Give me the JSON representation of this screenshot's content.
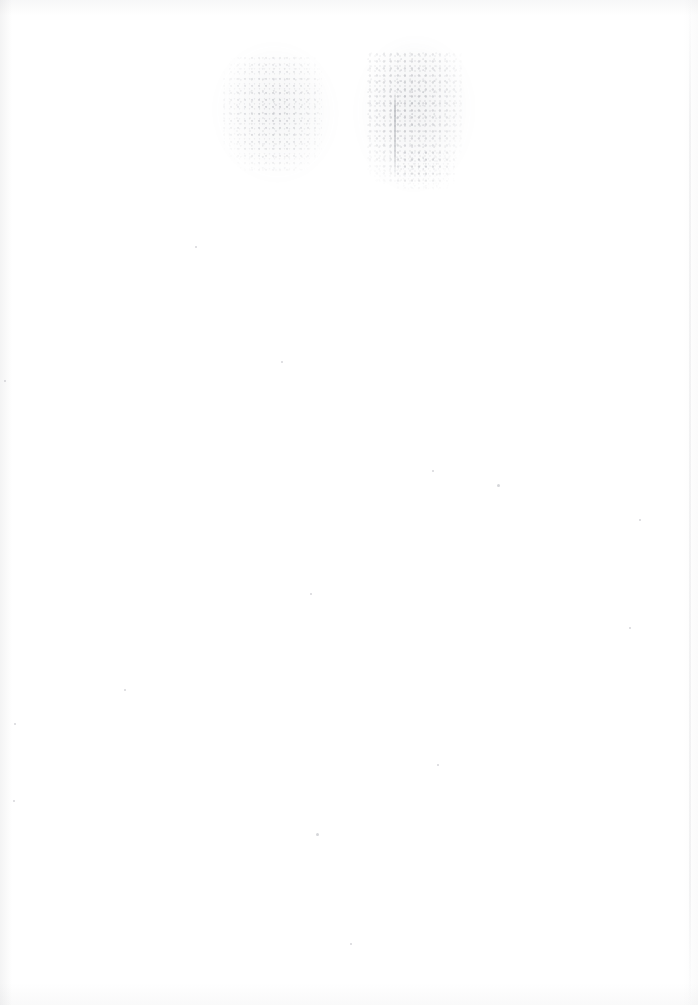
{
  "document": {
    "kind": "scanned-page",
    "page_label": "",
    "title": "",
    "body_text": "",
    "visible_text": "",
    "note": "Blank scanned sheet — no legible rendered text, headings, numbers, or UI controls appear in the pixels."
  },
  "page": {
    "width_px": 698,
    "height_px": 1005,
    "background_color": "#ffffff",
    "paper_tone": "#fdfdfd"
  },
  "artifacts": {
    "description": "Faint ink show-through from the reverse side of the sheet, plus scanner edge shading and a few dust specks.",
    "bleed_clusters": [
      {
        "name": "left-bleed-cluster",
        "x": 222,
        "y": 55,
        "width": 100,
        "height": 118,
        "ink_color": "#60646f",
        "opacity": 0.4
      },
      {
        "name": "right-bleed-cluster",
        "x": 366,
        "y": 52,
        "width": 96,
        "height": 132,
        "ink_color": "#585c68",
        "opacity": 0.45
      },
      {
        "name": "right-bleed-tail",
        "x": 396,
        "y": 150,
        "width": 62,
        "height": 40,
        "ink_color": "#6a6e78",
        "opacity": 0.28
      }
    ],
    "edge_shading": [
      {
        "name": "left-edge-shade",
        "edge": "left",
        "thickness_px": 12,
        "color": "#787a80"
      },
      {
        "name": "right-edge-shade",
        "edge": "right",
        "thickness_px": 26,
        "color": "#7d7f85"
      },
      {
        "name": "top-edge-shade",
        "edge": "top",
        "thickness_px": 16,
        "color": "#767880"
      },
      {
        "name": "bottom-edge-shade",
        "edge": "bottom",
        "thickness_px": 22,
        "color": "#767880"
      }
    ],
    "specks": [
      {
        "x": 316,
        "y": 833,
        "size": 3,
        "color": "#96989f"
      },
      {
        "x": 497,
        "y": 484,
        "size": 3,
        "color": "#96989f"
      },
      {
        "x": 432,
        "y": 470,
        "size": 2,
        "color": "#9a9ca2"
      },
      {
        "x": 124,
        "y": 689,
        "size": 2,
        "color": "#9a9ca2"
      },
      {
        "x": 14,
        "y": 723,
        "size": 2,
        "color": "#9a9ca2"
      },
      {
        "x": 639,
        "y": 519,
        "size": 2,
        "color": "#9a9ca2"
      },
      {
        "x": 281,
        "y": 361,
        "size": 2,
        "color": "#9a9ca2"
      },
      {
        "x": 4,
        "y": 380,
        "size": 2,
        "color": "#9a9ca2"
      },
      {
        "x": 310,
        "y": 593,
        "size": 2,
        "color": "#9a9ca2"
      },
      {
        "x": 437,
        "y": 764,
        "size": 2,
        "color": "#9a9ca2"
      },
      {
        "x": 13,
        "y": 800,
        "size": 2,
        "color": "#9a9ca2"
      },
      {
        "x": 350,
        "y": 943,
        "size": 2,
        "color": "#9a9ca2"
      },
      {
        "x": 195,
        "y": 246,
        "size": 2,
        "color": "#9a9ca2"
      },
      {
        "x": 629,
        "y": 627,
        "size": 2,
        "color": "#9a9ca2"
      }
    ]
  }
}
